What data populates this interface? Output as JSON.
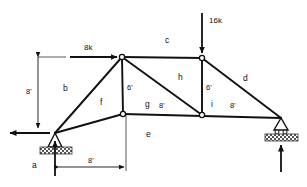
{
  "diagram": {
    "type": "structural-truss",
    "stroke_color": "#111111",
    "hatch_color": "#4a4a4a"
  },
  "loads": [
    {
      "id": "load-8k",
      "label": "8k",
      "magnitude": 8,
      "unit": "k",
      "direction": "right",
      "applied_at": "top-left-joint"
    },
    {
      "id": "load-16k",
      "label": "16k",
      "magnitude": 16,
      "unit": "k",
      "direction": "down",
      "applied_at": "top-right-joint"
    }
  ],
  "members": [
    {
      "id": "member-a",
      "label": "a"
    },
    {
      "id": "member-b",
      "label": "b"
    },
    {
      "id": "member-c",
      "label": "c"
    },
    {
      "id": "member-d",
      "label": "d"
    },
    {
      "id": "member-e",
      "label": "e"
    },
    {
      "id": "member-f",
      "label": "f"
    },
    {
      "id": "member-g",
      "label": "g"
    },
    {
      "id": "member-h",
      "label": "h"
    },
    {
      "id": "member-i",
      "label": "i"
    }
  ],
  "dimensions": [
    {
      "id": "dim-height-left",
      "label": "8'",
      "value": 8,
      "unit": "ft",
      "orientation": "vertical"
    },
    {
      "id": "dim-span-left",
      "label": "8'",
      "value": 8,
      "unit": "ft",
      "orientation": "horizontal"
    },
    {
      "id": "dim-vertical-left-post",
      "label": "6'",
      "value": 6,
      "unit": "ft",
      "orientation": "vertical"
    },
    {
      "id": "dim-vertical-right-post",
      "label": "6'",
      "value": 6,
      "unit": "ft",
      "orientation": "vertical"
    },
    {
      "id": "dim-panel-mid",
      "label": "8'",
      "value": 8,
      "unit": "ft",
      "orientation": "horizontal"
    },
    {
      "id": "dim-panel-right",
      "label": "8'",
      "value": 8,
      "unit": "ft",
      "orientation": "horizontal"
    }
  ],
  "supports": [
    {
      "id": "support-left",
      "kind": "pin",
      "reactions": [
        "vertical-up",
        "horizontal-left"
      ]
    },
    {
      "id": "support-right",
      "kind": "roller",
      "reactions": [
        "vertical-up"
      ]
    }
  ]
}
